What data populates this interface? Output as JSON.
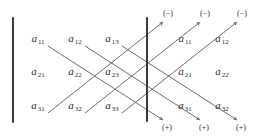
{
  "figure": {
    "stroke_color": "#6d6d72",
    "bar_color": "#3a3a3e",
    "text_color": "#2b2b2b",
    "background": "#ffffff"
  },
  "matrix": {
    "rows": [
      [
        {
          "base": "a",
          "sub": "11",
          "x": 38,
          "y": 40
        },
        {
          "base": "a",
          "sub": "12",
          "x": 75,
          "y": 40
        },
        {
          "base": "a",
          "sub": "13",
          "x": 112,
          "y": 40
        }
      ],
      [
        {
          "base": "a",
          "sub": "21",
          "x": 38,
          "y": 73
        },
        {
          "base": "a",
          "sub": "22",
          "x": 75,
          "y": 73
        },
        {
          "base": "a",
          "sub": "23",
          "x": 112,
          "y": 73
        }
      ],
      [
        {
          "base": "a",
          "sub": "31",
          "x": 38,
          "y": 107
        },
        {
          "base": "a",
          "sub": "32",
          "x": 75,
          "y": 107
        },
        {
          "base": "a",
          "sub": "33",
          "x": 112,
          "y": 107
        }
      ]
    ]
  },
  "repeated_columns": {
    "rows": [
      [
        {
          "base": "a",
          "sub": "11",
          "x": 185,
          "y": 40
        },
        {
          "base": "a",
          "sub": "12",
          "x": 222,
          "y": 40
        }
      ],
      [
        {
          "base": "a",
          "sub": "21",
          "x": 185,
          "y": 73
        },
        {
          "base": "a",
          "sub": "22",
          "x": 222,
          "y": 73
        }
      ],
      [
        {
          "base": "a",
          "sub": "31",
          "x": 185,
          "y": 107
        },
        {
          "base": "a",
          "sub": "32",
          "x": 222,
          "y": 107
        }
      ]
    ]
  },
  "signs": {
    "negative": [
      {
        "label": "(−)",
        "x": 168,
        "y": 14
      },
      {
        "label": "(−)",
        "x": 205,
        "y": 14
      },
      {
        "label": "(−)",
        "x": 242,
        "y": 14
      }
    ],
    "positive": [
      {
        "label": "(+)",
        "x": 167,
        "y": 128
      },
      {
        "label": "(+)",
        "x": 204,
        "y": 128
      },
      {
        "label": "(+)",
        "x": 241,
        "y": 128
      }
    ]
  },
  "bars": [
    {
      "name": "left-determinant-bar",
      "x": 13,
      "y1": 18,
      "y2": 122
    },
    {
      "name": "right-determinant-bar",
      "x": 147,
      "y1": 18,
      "y2": 121
    }
  ],
  "diagonals": {
    "descending": [
      {
        "name": "plus-diagonal-1",
        "x1": 48,
        "y1": 46,
        "x2": 163,
        "y2": 120
      },
      {
        "name": "plus-diagonal-2",
        "x1": 85,
        "y1": 46,
        "x2": 200,
        "y2": 120
      },
      {
        "name": "plus-diagonal-3",
        "x1": 122,
        "y1": 46,
        "x2": 237,
        "y2": 120
      }
    ],
    "ascending": [
      {
        "name": "minus-diagonal-1",
        "x1": 48,
        "y1": 113,
        "x2": 163,
        "y2": 22
      },
      {
        "name": "minus-diagonal-2",
        "x1": 85,
        "y1": 113,
        "x2": 200,
        "y2": 22
      },
      {
        "name": "minus-diagonal-3",
        "x1": 122,
        "y1": 113,
        "x2": 237,
        "y2": 22
      }
    ]
  }
}
